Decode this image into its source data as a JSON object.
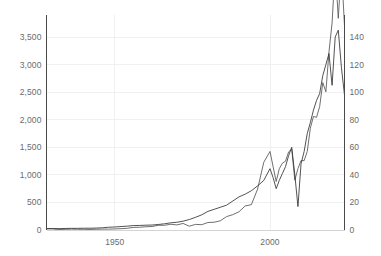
{
  "chart_data": {
    "type": "line",
    "title": "",
    "subtitle": "",
    "xlabel": "",
    "ylabel": "",
    "grid": true,
    "legend_position": "none",
    "xlim": [
      1928,
      2024
    ],
    "x_ticks": [
      1950,
      2000
    ],
    "x_tick_labels": [
      "1950",
      "2000"
    ],
    "left_axis": {
      "label": "",
      "ylim": [
        0,
        3900
      ],
      "ticks": [
        0,
        500,
        1000,
        1500,
        2000,
        2500,
        3000,
        3500
      ],
      "tick_labels": [
        "0",
        "500",
        "1,000",
        "1,500",
        "2,000",
        "2,500",
        "3,000",
        "3,500"
      ]
    },
    "right_axis": {
      "label": "",
      "ylim": [
        0,
        156
      ],
      "ticks": [
        0,
        20,
        40,
        60,
        80,
        100,
        120,
        140
      ],
      "tick_labels": [
        "0",
        "20",
        "40",
        "60",
        "80",
        "100",
        "120",
        "140"
      ]
    },
    "series": [
      {
        "name": "series-left-axis",
        "axis": "left",
        "color": "#555555",
        "x": [
          1928,
          1930,
          1932,
          1934,
          1936,
          1938,
          1940,
          1942,
          1944,
          1946,
          1948,
          1950,
          1952,
          1954,
          1956,
          1958,
          1960,
          1962,
          1964,
          1966,
          1968,
          1970,
          1972,
          1974,
          1976,
          1978,
          1980,
          1982,
          1984,
          1986,
          1988,
          1990,
          1992,
          1994,
          1996,
          1998,
          2000,
          2001,
          2002,
          2003,
          2004,
          2005,
          2006,
          2007,
          2008,
          2009,
          2010,
          2011,
          2012,
          2013,
          2014,
          2015,
          2016,
          2017,
          2018,
          2019,
          2020,
          2021,
          2022,
          2023,
          2024
        ],
        "values": [
          22,
          18,
          9,
          12,
          16,
          13,
          12,
          10,
          13,
          16,
          16,
          20,
          24,
          31,
          47,
          50,
          59,
          63,
          85,
          85,
          104,
          92,
          119,
          69,
          102,
          96,
          136,
          141,
          167,
          243,
          278,
          330,
          436,
          460,
          741,
          1229,
          1425,
          1148,
          880,
          1112,
          1212,
          1248,
          1418,
          1468,
          903,
          1115,
          1258,
          1258,
          1426,
          1848,
          2059,
          2044,
          2239,
          2674,
          2507,
          3231,
          3756,
          4766,
          3840,
          4770,
          3700
        ]
      },
      {
        "name": "series-right-axis",
        "axis": "right",
        "color": "#333333",
        "x": [
          1928,
          1930,
          1932,
          1934,
          1936,
          1938,
          1940,
          1942,
          1944,
          1946,
          1948,
          1950,
          1952,
          1954,
          1956,
          1958,
          1960,
          1962,
          1964,
          1966,
          1968,
          1970,
          1972,
          1974,
          1976,
          1978,
          1980,
          1982,
          1984,
          1986,
          1988,
          1990,
          1992,
          1994,
          1996,
          1998,
          2000,
          2001,
          2002,
          2003,
          2004,
          2005,
          2006,
          2007,
          2008,
          2009,
          2010,
          2011,
          2012,
          2013,
          2014,
          2015,
          2016,
          2017,
          2018,
          2019,
          2020,
          2021,
          2022,
          2023,
          2024
        ],
        "values": [
          1.0,
          1.1,
          1.0,
          1.1,
          1.2,
          1.2,
          1.3,
          1.3,
          1.4,
          1.6,
          2.0,
          2.2,
          2.5,
          2.8,
          3.2,
          3.3,
          3.5,
          3.6,
          4.0,
          4.5,
          5.2,
          5.6,
          6.4,
          7.6,
          9.2,
          11.0,
          13.5,
          15.0,
          16.5,
          18.0,
          21.0,
          24.0,
          26.0,
          28.5,
          32.0,
          36.0,
          44.5,
          38.0,
          30.0,
          36.0,
          41.0,
          46.0,
          54.0,
          60.0,
          40.0,
          17.0,
          48.0,
          57.0,
          70.0,
          78.0,
          87.0,
          94.0,
          99.0,
          112.0,
          120.0,
          128.0,
          105.0,
          140.0,
          145.0,
          118.0,
          98.0
        ]
      }
    ],
    "annotations": []
  },
  "colors": {
    "axis_spine": "#4a4a4a",
    "gridline": "#f0f0f2",
    "tick_text": "#6b6b6b",
    "background": "#ffffff"
  }
}
